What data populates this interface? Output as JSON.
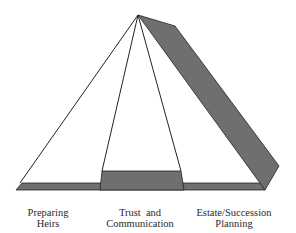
{
  "diagram": {
    "type": "pyramid",
    "colors": {
      "fill_gray": "#6f6f6f",
      "line": "#222222",
      "background": "#ffffff"
    },
    "labels": [
      {
        "line1": "Preparing",
        "line2": "Heirs"
      },
      {
        "line1": "Trust  and",
        "line2": "Communication"
      },
      {
        "line1": "Estate/Succession",
        "line2": "Planning"
      }
    ]
  }
}
